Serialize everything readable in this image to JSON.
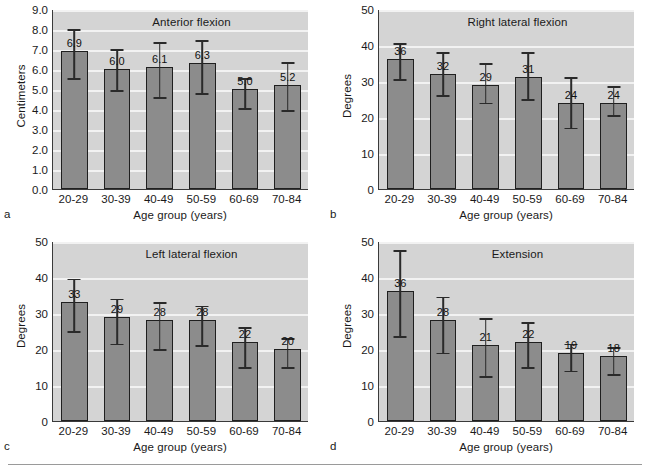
{
  "figure": {
    "panels": [
      {
        "letter": "a",
        "title": "Anterior flexion",
        "ylabel": "Centimeters",
        "xlabel": "Age group (years)",
        "yticks": [
          "0.0",
          "1.0",
          "2.0",
          "3.0",
          "4.0",
          "5.0",
          "6.0",
          "7.0",
          "8.0",
          "9.0"
        ],
        "categories": [
          "20-29",
          "30-39",
          "40-49",
          "50-59",
          "60-69",
          "70-84"
        ],
        "values": [
          6.9,
          6.0,
          6.1,
          6.3,
          5.0,
          5.2
        ],
        "labels": [
          "6.9",
          "6.0",
          "6.1",
          "6.3",
          "5.0",
          "5.2"
        ],
        "err_upper": [
          8.0,
          7.0,
          7.35,
          7.45,
          5.55,
          6.35
        ],
        "err_lower": [
          5.55,
          4.95,
          4.6,
          4.8,
          4.05,
          3.95
        ],
        "ymin": 0,
        "ymax": 9
      },
      {
        "letter": "b",
        "title": "Right lateral flexion",
        "ylabel": "Degrees",
        "xlabel": "Age group (years)",
        "yticks": [
          "0",
          "10",
          "20",
          "30",
          "40",
          "50"
        ],
        "categories": [
          "20-29",
          "30-39",
          "40-49",
          "50-59",
          "60-69",
          "70-84"
        ],
        "values": [
          36,
          32,
          29,
          31,
          24,
          24
        ],
        "labels": [
          "36",
          "32",
          "29",
          "31",
          "24",
          "24"
        ],
        "err_upper": [
          40.5,
          38.0,
          35.0,
          38.0,
          31.0,
          28.5
        ],
        "err_lower": [
          30.5,
          26.0,
          24.0,
          25.0,
          17.0,
          20.5
        ],
        "ymin": 0,
        "ymax": 50
      },
      {
        "letter": "c",
        "title": "Left lateral flexion",
        "ylabel": "Degrees",
        "xlabel": "Age group (years)",
        "yticks": [
          "0",
          "10",
          "20",
          "30",
          "40",
          "50"
        ],
        "categories": [
          "20-29",
          "30-39",
          "40-49",
          "50-59",
          "60-69",
          "70-84"
        ],
        "values": [
          33,
          29,
          28,
          28,
          22,
          20
        ],
        "labels": [
          "33",
          "29",
          "28",
          "28",
          "22",
          "20"
        ],
        "err_upper": [
          39.5,
          34.0,
          33.0,
          32.0,
          26.0,
          23.0
        ],
        "err_lower": [
          25.0,
          21.5,
          20.0,
          21.0,
          15.0,
          15.0
        ],
        "ymin": 0,
        "ymax": 50
      },
      {
        "letter": "d",
        "title": "Extension",
        "ylabel": "Degrees",
        "xlabel": "Age group (years)",
        "yticks": [
          "0",
          "10",
          "20",
          "30",
          "40",
          "50"
        ],
        "categories": [
          "20-29",
          "30-39",
          "40-49",
          "50-59",
          "60-69",
          "70-84"
        ],
        "values": [
          36,
          28,
          21,
          22,
          19,
          18
        ],
        "labels": [
          "36",
          "28",
          "21",
          "22",
          "19",
          "18"
        ],
        "err_upper": [
          47.5,
          34.5,
          28.5,
          27.5,
          21.5,
          20.5
        ],
        "err_lower": [
          23.5,
          19.0,
          12.5,
          15.0,
          14.0,
          13.0
        ],
        "ymin": 0,
        "ymax": 50
      }
    ]
  },
  "chart_data": [
    {
      "type": "bar",
      "panel": "a",
      "title": "Anterior flexion",
      "xlabel": "Age group (years)",
      "ylabel": "Centimeters",
      "categories": [
        "20-29",
        "30-39",
        "40-49",
        "50-59",
        "60-69",
        "70-84"
      ],
      "values": [
        6.9,
        6.0,
        6.1,
        6.3,
        5.0,
        5.2
      ],
      "error_bars": {
        "upper": [
          8.0,
          7.0,
          7.35,
          7.45,
          5.55,
          6.35
        ],
        "lower": [
          5.55,
          4.95,
          4.6,
          4.8,
          4.05,
          3.95
        ]
      },
      "ylim": [
        0,
        9
      ],
      "ytick_step": 1.0,
      "grid": true,
      "legend": "none"
    },
    {
      "type": "bar",
      "panel": "b",
      "title": "Right lateral flexion",
      "xlabel": "Age group (years)",
      "ylabel": "Degrees",
      "categories": [
        "20-29",
        "30-39",
        "40-49",
        "50-59",
        "60-69",
        "70-84"
      ],
      "values": [
        36,
        32,
        29,
        31,
        24,
        24
      ],
      "error_bars": {
        "upper": [
          40.5,
          38.0,
          35.0,
          38.0,
          31.0,
          28.5
        ],
        "lower": [
          30.5,
          26.0,
          24.0,
          25.0,
          17.0,
          20.5
        ]
      },
      "ylim": [
        0,
        50
      ],
      "ytick_step": 10,
      "grid": true,
      "legend": "none"
    },
    {
      "type": "bar",
      "panel": "c",
      "title": "Left lateral flexion",
      "xlabel": "Age group (years)",
      "ylabel": "Degrees",
      "categories": [
        "20-29",
        "30-39",
        "40-49",
        "50-59",
        "60-69",
        "70-84"
      ],
      "values": [
        33,
        29,
        28,
        28,
        22,
        20
      ],
      "error_bars": {
        "upper": [
          39.5,
          34.0,
          33.0,
          32.0,
          26.0,
          23.0
        ],
        "lower": [
          25.0,
          21.5,
          20.0,
          21.0,
          15.0,
          15.0
        ]
      },
      "ylim": [
        0,
        50
      ],
      "ytick_step": 10,
      "grid": true,
      "legend": "none"
    },
    {
      "type": "bar",
      "panel": "d",
      "title": "Extension",
      "xlabel": "Age group (years)",
      "ylabel": "Degrees",
      "categories": [
        "20-29",
        "30-39",
        "40-49",
        "50-59",
        "60-69",
        "70-84"
      ],
      "values": [
        36,
        28,
        21,
        22,
        19,
        18
      ],
      "error_bars": {
        "upper": [
          47.5,
          34.5,
          28.5,
          27.5,
          21.5,
          20.5
        ],
        "lower": [
          23.5,
          19.0,
          12.5,
          15.0,
          14.0,
          13.0
        ]
      },
      "ylim": [
        0,
        50
      ],
      "ytick_step": 10,
      "grid": true,
      "legend": "none"
    }
  ],
  "colors": {
    "plot_background": "#d4d4d4",
    "gridline": "#f2f2f2",
    "bar_fill": "#8c8c8c",
    "bar_edge": "#1f1f1f",
    "axis": "#3a3a3a",
    "text": "#1a1a1a",
    "page_background": "#ffffff"
  }
}
